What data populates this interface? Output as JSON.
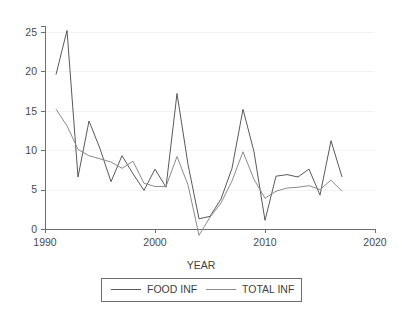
{
  "chart_data": {
    "type": "line",
    "title": "",
    "subtitle": "",
    "xlabel": "YEAR",
    "ylabel": "",
    "xlim": [
      1990,
      2020
    ],
    "ylim": [
      -2.5,
      26.5
    ],
    "xticks": [
      "1990",
      "2000",
      "2010",
      "2020"
    ],
    "xtick_values": [
      1990,
      2000,
      2010,
      2020
    ],
    "yticks": [
      "0",
      "5",
      "10",
      "15",
      "20",
      "25"
    ],
    "ytick_values": [
      0,
      5,
      10,
      15,
      20,
      25
    ],
    "grid": "horizontal-faint",
    "legend_position": "bottom-outside",
    "x": [
      1991,
      1992,
      1993,
      1994,
      1995,
      1996,
      1997,
      1998,
      1999,
      2000,
      2001,
      2002,
      2003,
      2004,
      2005,
      2006,
      2007,
      2008,
      2009,
      2010,
      2011,
      2012,
      2013,
      2014,
      2015,
      2016,
      2017
    ],
    "series": [
      {
        "name": "FOOD INF",
        "color": "#595959",
        "values": [
          19.6,
          25.2,
          6.6,
          13.7,
          10.2,
          6.0,
          9.3,
          7.0,
          4.9,
          7.6,
          5.3,
          17.2,
          8.2,
          1.3,
          1.6,
          3.8,
          7.7,
          15.2,
          9.8,
          1.1,
          6.7,
          6.9,
          6.6,
          7.6,
          4.3,
          11.2,
          6.6
        ]
      },
      {
        "name": "TOTAL INF",
        "color": "#8c8c8c",
        "values": [
          15.2,
          13.1,
          10.1,
          9.3,
          8.9,
          8.5,
          7.7,
          8.6,
          5.8,
          5.4,
          5.4,
          9.2,
          5.6,
          -0.8,
          1.5,
          3.3,
          6.1,
          9.8,
          6.3,
          3.9,
          4.8,
          5.2,
          5.3,
          5.5,
          5.0,
          6.2,
          4.8
        ]
      }
    ]
  },
  "legend": {
    "items": [
      {
        "label": "FOOD INF"
      },
      {
        "label": "TOTAL INF"
      }
    ]
  },
  "axes": {
    "x_title": "YEAR"
  }
}
